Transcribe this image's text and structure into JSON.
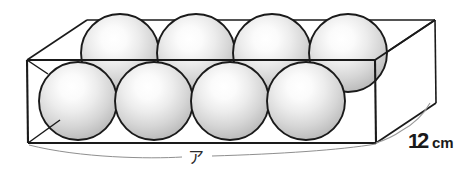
{
  "figure": {
    "colors": {
      "outline": "#1a1a1a",
      "sphere_highlight": "#ffffff",
      "sphere_mid": "#e8e8e8",
      "sphere_edge": "#b9b9b9",
      "sphere_outline": "#1a1a1a",
      "leader_line": "#8a8a8a",
      "background": "#ffffff"
    }
  },
  "labels": {
    "depth": {
      "text": "12cm",
      "digit_one": "1",
      "digit_two": "2",
      "unit": "cm",
      "role": "box-depth-dimension"
    },
    "length": {
      "text": "ア",
      "role": "box-length-unknown-label"
    }
  },
  "spheres": {
    "count": 8,
    "rows": 2,
    "per_row": 4,
    "radius_px": 39,
    "front_row": [
      {
        "cx": 78,
        "cy": 101
      },
      {
        "cx": 154,
        "cy": 101
      },
      {
        "cx": 230,
        "cy": 101
      },
      {
        "cx": 306,
        "cy": 101
      }
    ],
    "back_row": [
      {
        "cx": 120,
        "cy": 53
      },
      {
        "cx": 196,
        "cy": 53
      },
      {
        "cx": 272,
        "cy": 53
      },
      {
        "cx": 348,
        "cy": 53
      }
    ]
  },
  "box": {
    "near_top_left": {
      "x": 27,
      "y": 60
    },
    "near_top_right": {
      "x": 375,
      "y": 60
    },
    "near_bottom_left": {
      "x": 28,
      "y": 143
    },
    "near_bottom_right": {
      "x": 376,
      "y": 143
    },
    "far_top_left": {
      "x": 87,
      "y": 20
    },
    "far_top_right": {
      "x": 435,
      "y": 20
    },
    "far_bottom_right": {
      "x": 436,
      "y": 103
    }
  }
}
